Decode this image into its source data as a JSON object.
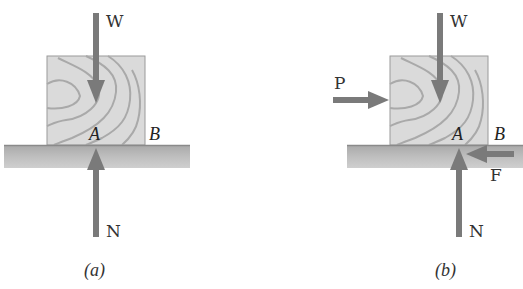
{
  "figure": {
    "panels": [
      {
        "id": "a",
        "caption": "(a)",
        "labels": {
          "weight": "W",
          "normal": "N",
          "point_a": "A",
          "point_b": "B"
        }
      },
      {
        "id": "b",
        "caption": "(b)",
        "labels": {
          "weight": "W",
          "normal": "N",
          "push": "P",
          "friction": "F",
          "point_a": "A",
          "point_b": "B"
        }
      }
    ],
    "colors": {
      "arrow": "#7a7a7a",
      "block_fill": "#d9d9d9",
      "wood_grain": "#a8a8a8",
      "ground_top": "#8c8c8c",
      "ground_fill": "#bdbdbd"
    }
  }
}
